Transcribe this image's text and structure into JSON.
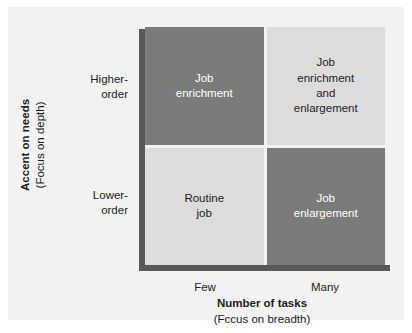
{
  "figure": {
    "background_color": "#ffffff",
    "panel_color": "#f2f2f2"
  },
  "colors": {
    "quadrant_dark": "#7b7b7b",
    "quadrant_light": "#dcdcdc",
    "axis_line": "#585858",
    "text_dark": "#1c1c1c",
    "text_light": "#ffffff"
  },
  "y_axis": {
    "title_main": "Accent on needs",
    "title_sub": "(Focus on depth)",
    "ticks": [
      {
        "label": "Higher-\norder",
        "position": "top"
      },
      {
        "label": "Lower-\norder",
        "position": "bottom"
      }
    ]
  },
  "x_axis": {
    "title_main": "Number of tasks",
    "title_sub": "(Fccus on breadth)",
    "ticks": [
      {
        "label": "Few",
        "position": "left"
      },
      {
        "label": "Many",
        "position": "right"
      }
    ]
  },
  "chart_data": {
    "type": "table",
    "xlabel": "Number of tasks (Fccus on breadth)",
    "ylabel": "Accent on needs (Focus on depth)",
    "x_categories": [
      "Few",
      "Many"
    ],
    "y_categories": [
      "Higher-order",
      "Lower-order"
    ],
    "cells": [
      {
        "row": "Higher-order",
        "column": "Few",
        "label": "Job\nenrichment",
        "fill": "#7b7b7b",
        "text_color": "#ffffff"
      },
      {
        "row": "Higher-order",
        "column": "Many",
        "label": "Job\nenrichment\nand\nenlargement",
        "fill": "#dcdcdc",
        "text_color": "#1c1c1c"
      },
      {
        "row": "Lower-order",
        "column": "Few",
        "label": "Routine\njob",
        "fill": "#dcdcdc",
        "text_color": "#1c1c1c"
      },
      {
        "row": "Lower-order",
        "column": "Many",
        "label": "Job\nenlargement",
        "fill": "#7b7b7b",
        "text_color": "#ffffff"
      }
    ]
  }
}
